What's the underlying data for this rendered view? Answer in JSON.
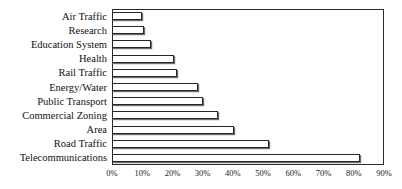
{
  "chart_data": {
    "type": "bar",
    "orientation": "horizontal",
    "title": "",
    "xlabel": "",
    "ylabel": "",
    "xlim": [
      0,
      90
    ],
    "xticks": [
      "0%",
      "10%",
      "20%",
      "30%",
      "40%",
      "50%",
      "60%",
      "70%",
      "80%",
      "90%"
    ],
    "xtick_values": [
      0,
      10,
      20,
      30,
      40,
      50,
      60,
      70,
      80,
      90
    ],
    "grid": false,
    "legend": "none",
    "bar_style": {
      "fill": "#ffffff",
      "edge": "#262626",
      "shadow": "#6e6e6e"
    },
    "categories": [
      "Air Traffic",
      "Research",
      "Education System",
      "Health",
      "Rail Traffic",
      "Energy/Water",
      "Public Transport",
      "Commercial Zoning",
      "Area",
      "Road Traffic",
      "Telecommunications"
    ],
    "values": [
      10,
      10.5,
      13,
      20.5,
      21.5,
      28.5,
      30,
      35,
      40.5,
      52,
      82
    ],
    "value_labels": [
      "10%",
      "10.5%",
      "13%",
      "20.5%",
      "21.5%",
      "28.5%",
      "30%",
      "35%",
      "40.5%",
      "52%",
      "82%"
    ]
  },
  "figure": {
    "clipped_title": "",
    "background": "#ffffff",
    "frame_color": "#2b2b2b"
  }
}
